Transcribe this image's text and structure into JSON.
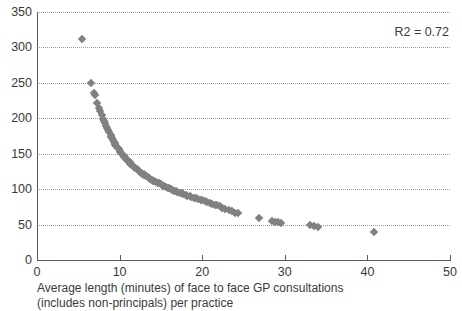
{
  "chart_data": {
    "type": "scatter",
    "title": "",
    "subtitle": "",
    "xlabel_lines": [
      "Average length (minutes) of face to face GP consultations",
      "(includes non-principals) per practice"
    ],
    "ylabel": "",
    "xlim": [
      0,
      50
    ],
    "ylim": [
      0,
      350
    ],
    "xticks": [
      0,
      10,
      20,
      30,
      40,
      50
    ],
    "yticks": [
      0,
      50,
      100,
      150,
      200,
      250,
      300,
      350
    ],
    "xtick_labels": [
      "0",
      "10",
      "20",
      "30",
      "40",
      "50"
    ],
    "ytick_labels": [
      "0",
      "50",
      "100",
      "150",
      "200",
      "250",
      "300",
      "350"
    ],
    "grid": "horizontal-dotted",
    "legend": "none",
    "annotations": [
      {
        "text": "R2 = 0.72",
        "position": "top-right"
      }
    ],
    "marker": {
      "shape": "diamond",
      "color": "#808080",
      "size": 6
    },
    "series": [
      {
        "name": "practices",
        "points": [
          [
            5.4,
            312
          ],
          [
            6.5,
            250
          ],
          [
            6.9,
            236
          ],
          [
            7.0,
            233
          ],
          [
            7.3,
            221
          ],
          [
            7.5,
            215
          ],
          [
            7.6,
            210
          ],
          [
            7.9,
            204
          ],
          [
            8.0,
            199
          ],
          [
            8.1,
            196
          ],
          [
            8.2,
            193
          ],
          [
            8.4,
            189
          ],
          [
            8.5,
            186
          ],
          [
            8.6,
            183
          ],
          [
            8.7,
            180
          ],
          [
            8.9,
            177
          ],
          [
            9.0,
            174
          ],
          [
            9.1,
            172
          ],
          [
            9.2,
            169
          ],
          [
            9.3,
            167
          ],
          [
            9.4,
            165
          ],
          [
            9.5,
            163
          ],
          [
            9.6,
            161
          ],
          [
            9.8,
            158
          ],
          [
            9.9,
            156
          ],
          [
            10.0,
            154
          ],
          [
            10.1,
            152
          ],
          [
            10.3,
            150
          ],
          [
            10.4,
            148
          ],
          [
            10.5,
            146
          ],
          [
            10.6,
            145
          ],
          [
            10.8,
            143
          ],
          [
            10.9,
            141
          ],
          [
            11.0,
            140
          ],
          [
            11.2,
            138
          ],
          [
            11.3,
            136
          ],
          [
            11.5,
            134
          ],
          [
            11.6,
            133
          ],
          [
            11.8,
            131
          ],
          [
            11.9,
            130
          ],
          [
            12.1,
            128
          ],
          [
            12.2,
            127
          ],
          [
            12.4,
            125
          ],
          [
            12.5,
            124
          ],
          [
            12.7,
            122
          ],
          [
            12.9,
            121
          ],
          [
            13.0,
            120
          ],
          [
            13.2,
            118
          ],
          [
            13.4,
            117
          ],
          [
            13.5,
            116
          ],
          [
            13.7,
            115
          ],
          [
            13.9,
            113
          ],
          [
            14.1,
            112
          ],
          [
            14.2,
            111
          ],
          [
            14.4,
            110
          ],
          [
            14.6,
            109
          ],
          [
            14.8,
            108
          ],
          [
            15.0,
            107
          ],
          [
            15.2,
            105
          ],
          [
            15.4,
            104
          ],
          [
            15.6,
            103
          ],
          [
            15.8,
            102
          ],
          [
            16.0,
            101
          ],
          [
            16.2,
            100
          ],
          [
            16.4,
            99
          ],
          [
            16.6,
            98
          ],
          [
            16.8,
            97
          ],
          [
            17.0,
            96
          ],
          [
            17.3,
            95
          ],
          [
            17.5,
            94
          ],
          [
            17.7,
            93
          ],
          [
            18.0,
            92
          ],
          [
            18.2,
            91
          ],
          [
            18.5,
            90
          ],
          [
            18.7,
            89
          ],
          [
            19.0,
            88
          ],
          [
            19.2,
            87
          ],
          [
            19.5,
            86
          ],
          [
            19.8,
            85
          ],
          [
            20.0,
            84
          ],
          [
            20.3,
            83
          ],
          [
            20.6,
            82
          ],
          [
            20.9,
            81
          ],
          [
            21.2,
            79
          ],
          [
            21.5,
            78
          ],
          [
            21.8,
            77
          ],
          [
            22.1,
            76
          ],
          [
            22.4,
            74
          ],
          [
            22.8,
            72
          ],
          [
            23.2,
            71
          ],
          [
            23.6,
            69
          ],
          [
            24.0,
            67
          ],
          [
            24.3,
            66
          ],
          [
            26.9,
            59
          ],
          [
            28.4,
            55
          ],
          [
            28.8,
            54
          ],
          [
            29.2,
            53
          ],
          [
            29.6,
            52
          ],
          [
            33.0,
            49
          ],
          [
            33.5,
            48
          ],
          [
            34.0,
            47
          ],
          [
            40.8,
            40
          ]
        ]
      }
    ]
  }
}
